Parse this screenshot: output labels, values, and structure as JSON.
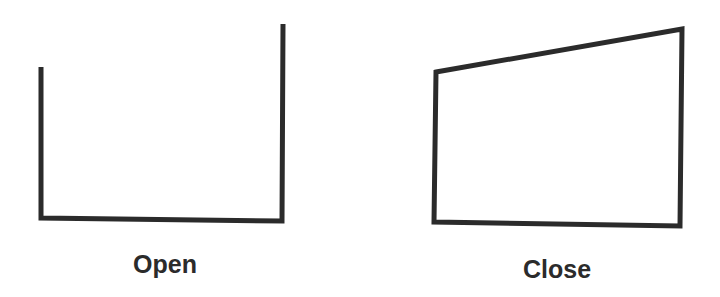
{
  "diagram": {
    "stroke_color": "#2b2b2b",
    "stroke_width": 5,
    "shapes": [
      {
        "id": "open",
        "label": "Open",
        "closed": false,
        "points": "41,67 41,218 282,221 283,24",
        "label_x": 165,
        "label_y": 250
      },
      {
        "id": "close",
        "label": "Close",
        "closed": true,
        "points": "436,72 682,29 680,226 434,222",
        "label_x": 557,
        "label_y": 255
      }
    ]
  }
}
